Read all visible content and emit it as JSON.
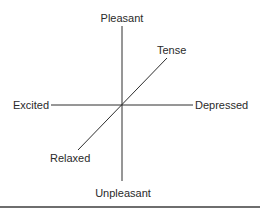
{
  "diagram": {
    "type": "mood-axes",
    "center": "origin",
    "axes": [
      {
        "name": "pleasantness",
        "positive": "Pleasant",
        "negative": "Unpleasant"
      },
      {
        "name": "arousal",
        "positive": "Excited",
        "negative": "Depressed"
      },
      {
        "name": "tension",
        "positive": "Tense",
        "negative": "Relaxed"
      }
    ],
    "labels": {
      "top": "Pleasant",
      "bottom": "Unpleasant",
      "left": "Excited",
      "right": "Depressed",
      "upper_right": "Tense",
      "lower_left": "Relaxed"
    },
    "colors": {
      "line": "#2e2e2e",
      "text": "#2a2a2a",
      "rule": "#6e6e6e"
    }
  }
}
